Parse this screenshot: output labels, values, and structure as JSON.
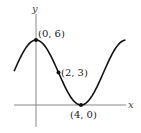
{
  "chart_data": {
    "type": "line",
    "title": "",
    "xlabel": "x",
    "ylabel": "y",
    "function": "y = 3 + 3cos(pi x / 4)",
    "x": [
      -2,
      -1,
      0,
      1,
      2,
      3,
      4,
      5,
      6,
      7
    ],
    "values": [
      3,
      5.12,
      6,
      5.12,
      3,
      0.88,
      0,
      0.88,
      3,
      5.12
    ],
    "points": [
      {
        "x": 0,
        "y": 6,
        "label": "(0, 6)"
      },
      {
        "x": 2,
        "y": 3,
        "label": "(2, 3)"
      },
      {
        "x": 4,
        "y": 0,
        "label": "(4, 0)"
      }
    ],
    "grid": false,
    "legend": null
  },
  "axes": {
    "x_label": "x",
    "y_label": "y"
  },
  "labels": {
    "p1": "(0, 6)",
    "p2": "(2, 3)",
    "p3": "(4, 0)"
  },
  "colors": {
    "curve": "#111111",
    "axes": "#777777"
  }
}
